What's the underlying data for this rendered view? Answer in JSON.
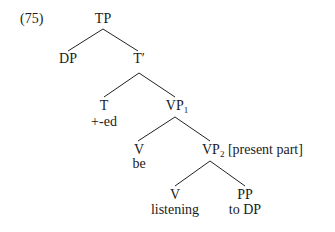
{
  "example_number": "(75)",
  "nodes": {
    "tp": {
      "label": "TP"
    },
    "dp": {
      "label": "DP"
    },
    "tbar": {
      "label": "T′"
    },
    "t": {
      "label": "T",
      "terminal": "+-ed"
    },
    "vp1": {
      "label": "VP",
      "subscript": "1"
    },
    "v_be": {
      "label": "V",
      "terminal": "be"
    },
    "vp2": {
      "label": "VP",
      "subscript": "2",
      "feature": "[present part]"
    },
    "v_listening": {
      "label": "V",
      "terminal": "listening"
    },
    "pp": {
      "label": "PP",
      "terminal": "to DP"
    }
  },
  "edges": [
    {
      "from": "tp",
      "to": "dp",
      "x1": 103,
      "y1": 29,
      "x2": 68,
      "y2": 51
    },
    {
      "from": "tp",
      "to": "tbar",
      "x1": 103,
      "y1": 29,
      "x2": 138,
      "y2": 51
    },
    {
      "from": "tbar",
      "to": "t",
      "x1": 139,
      "y1": 73,
      "x2": 104,
      "y2": 97
    },
    {
      "from": "tbar",
      "to": "vp1",
      "x1": 139,
      "y1": 73,
      "x2": 175,
      "y2": 97
    },
    {
      "from": "vp1",
      "to": "v_be",
      "x1": 175,
      "y1": 117,
      "x2": 138,
      "y2": 141
    },
    {
      "from": "vp1",
      "to": "vp2",
      "x1": 175,
      "y1": 117,
      "x2": 210,
      "y2": 141
    },
    {
      "from": "vp2",
      "to": "v_listening",
      "x1": 210,
      "y1": 161,
      "x2": 175,
      "y2": 186
    },
    {
      "from": "vp2",
      "to": "pp",
      "x1": 210,
      "y1": 161,
      "x2": 245,
      "y2": 186
    }
  ]
}
